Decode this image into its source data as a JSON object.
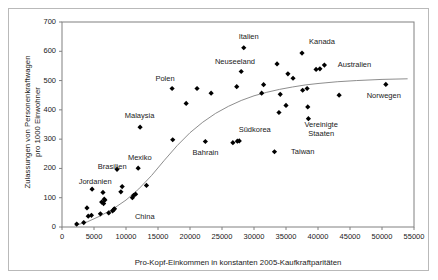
{
  "chart_data": {
    "type": "scatter",
    "title": "",
    "xlabel": "Pro-Kopf-Einkommen in konstanten 2005-Kaufkraftparitäten",
    "ylabel": "Zulassungen von Personenkraftwagen pro 1000 Einwohner",
    "xlim": [
      0,
      55000
    ],
    "ylim": [
      0,
      700
    ],
    "xticks": [
      0,
      5000,
      10000,
      15000,
      20000,
      25000,
      30000,
      35000,
      40000,
      45000,
      50000,
      55000
    ],
    "yticks": [
      0,
      100,
      200,
      300,
      400,
      500,
      600,
      700
    ],
    "xtick_labels": [
      "0",
      "5000",
      "10000",
      "15000",
      "20000",
      "25000",
      "30000",
      "35000",
      "40000",
      "45000",
      "50000",
      "55000"
    ],
    "ytick_labels": [
      "0",
      "100",
      "200",
      "300",
      "400",
      "500",
      "600",
      "700"
    ],
    "grid": false,
    "legend": null,
    "marker": "diamond",
    "marker_color": "#000000",
    "trendline": {
      "present": true,
      "color": "#808080",
      "style": "solid",
      "description": "S-förmige Trendkurve (logistisch)",
      "points": [
        [
          2000,
          5
        ],
        [
          4000,
          18
        ],
        [
          6000,
          38
        ],
        [
          8000,
          62
        ],
        [
          10000,
          92
        ],
        [
          12000,
          130
        ],
        [
          14000,
          176
        ],
        [
          16000,
          228
        ],
        [
          18000,
          278
        ],
        [
          20000,
          322
        ],
        [
          22000,
          358
        ],
        [
          24000,
          388
        ],
        [
          26000,
          412
        ],
        [
          28000,
          432
        ],
        [
          30000,
          448
        ],
        [
          32000,
          460
        ],
        [
          34000,
          470
        ],
        [
          36000,
          478
        ],
        [
          38000,
          485
        ],
        [
          40000,
          490
        ],
        [
          43000,
          496
        ],
        [
          46000,
          500
        ],
        [
          50000,
          504
        ],
        [
          54000,
          506
        ]
      ]
    },
    "points": [
      {
        "x": 2300,
        "y": 10,
        "label": null
      },
      {
        "x": 3400,
        "y": 15,
        "label": null
      },
      {
        "x": 3900,
        "y": 65,
        "label": null
      },
      {
        "x": 4100,
        "y": 37,
        "label": null
      },
      {
        "x": 4600,
        "y": 40,
        "label": null
      },
      {
        "x": 4700,
        "y": 129,
        "label": "Jordanien"
      },
      {
        "x": 6000,
        "y": 45,
        "label": null
      },
      {
        "x": 6200,
        "y": 85,
        "label": null
      },
      {
        "x": 6400,
        "y": 118,
        "label": null
      },
      {
        "x": 6500,
        "y": 80,
        "label": null
      },
      {
        "x": 6600,
        "y": 95,
        "label": null
      },
      {
        "x": 6700,
        "y": 92,
        "label": null
      },
      {
        "x": 7300,
        "y": 48,
        "label": null
      },
      {
        "x": 7900,
        "y": 55,
        "label": null
      },
      {
        "x": 8100,
        "y": 60,
        "label": null
      },
      {
        "x": 8200,
        "y": 62,
        "label": null
      },
      {
        "x": 8600,
        "y": 197,
        "label": "Brasilien"
      },
      {
        "x": 9200,
        "y": 120,
        "label": null
      },
      {
        "x": 9400,
        "y": 138,
        "label": null
      },
      {
        "x": 11000,
        "y": 100,
        "label": null
      },
      {
        "x": 11200,
        "y": 108,
        "label": null
      },
      {
        "x": 11500,
        "y": 112,
        "label": null
      },
      {
        "x": 11900,
        "y": 201,
        "label": "Mexiko"
      },
      {
        "x": 12200,
        "y": 341,
        "label": "Malaysia"
      },
      {
        "x": 13200,
        "y": 142,
        "label": null
      },
      {
        "x": 17200,
        "y": 473,
        "label": "Polen"
      },
      {
        "x": 17300,
        "y": 298,
        "label": null
      },
      {
        "x": 19400,
        "y": 422,
        "label": null
      },
      {
        "x": 21100,
        "y": 473,
        "label": null
      },
      {
        "x": 22400,
        "y": 292,
        "label": "Bahrain"
      },
      {
        "x": 23300,
        "y": 457,
        "label": null
      },
      {
        "x": 26700,
        "y": 288,
        "label": null
      },
      {
        "x": 27300,
        "y": 479,
        "label": null
      },
      {
        "x": 27400,
        "y": 293,
        "label": "Südkorea"
      },
      {
        "x": 27700,
        "y": 294,
        "label": null
      },
      {
        "x": 28000,
        "y": 531,
        "label": "Neuseeland"
      },
      {
        "x": 28400,
        "y": 612,
        "label": "Italien"
      },
      {
        "x": 31200,
        "y": 457,
        "label": null
      },
      {
        "x": 31500,
        "y": 486,
        "label": null
      },
      {
        "x": 33200,
        "y": 257,
        "label": "Taiwan"
      },
      {
        "x": 33600,
        "y": 557,
        "label": null
      },
      {
        "x": 33900,
        "y": 391,
        "label": null
      },
      {
        "x": 34100,
        "y": 453,
        "label": null
      },
      {
        "x": 35000,
        "y": 415,
        "label": null
      },
      {
        "x": 35300,
        "y": 523,
        "label": null
      },
      {
        "x": 36100,
        "y": 508,
        "label": null
      },
      {
        "x": 37500,
        "y": 594,
        "label": "Kanada"
      },
      {
        "x": 37600,
        "y": 467,
        "label": null
      },
      {
        "x": 38300,
        "y": 473,
        "label": null
      },
      {
        "x": 38400,
        "y": 410,
        "label": null
      },
      {
        "x": 38500,
        "y": 370,
        "label": "Vereinigte Staaten"
      },
      {
        "x": 39700,
        "y": 538,
        "label": null
      },
      {
        "x": 40300,
        "y": 540,
        "label": null
      },
      {
        "x": 41000,
        "y": 553,
        "label": "Australien"
      },
      {
        "x": 43300,
        "y": 450,
        "label": null
      },
      {
        "x": 50600,
        "y": 487,
        "label": "Norwegen"
      }
    ],
    "annotations": [
      {
        "text": "China",
        "x": 11400,
        "y": 33,
        "anchor": "label-only"
      },
      {
        "text": "Jordanien",
        "x": 2600,
        "y": 155,
        "anchor": "Jordanien"
      },
      {
        "text": "Brasilien",
        "x": 5600,
        "y": 205,
        "anchor": "Brasilien"
      },
      {
        "text": "Mexiko",
        "x": 10300,
        "y": 235,
        "anchor": "Mexiko"
      },
      {
        "text": "Malaysia",
        "x": 9800,
        "y": 380,
        "anchor": "Malaysia"
      },
      {
        "text": "Polen",
        "x": 14600,
        "y": 505,
        "anchor": "Polen"
      },
      {
        "text": "Bahrain",
        "x": 20400,
        "y": 252,
        "anchor": "Bahrain"
      },
      {
        "text": "Südkorea",
        "x": 27600,
        "y": 330,
        "anchor": "Südkorea"
      },
      {
        "text": "Neuseeland",
        "x": 23900,
        "y": 562,
        "anchor": "Neuseeland"
      },
      {
        "text": "Italien",
        "x": 27600,
        "y": 648,
        "anchor": "Italien"
      },
      {
        "text": "Taiwan",
        "x": 35800,
        "y": 257,
        "anchor": "Taiwan"
      },
      {
        "text": "Kanada",
        "x": 38600,
        "y": 632,
        "anchor": "Kanada"
      },
      {
        "text": "Australien",
        "x": 43100,
        "y": 553,
        "anchor": "Australien"
      },
      {
        "text": "Vereinigte Staaten",
        "x": 40500,
        "y": 350,
        "anchor": "Vereinigte Staaten"
      },
      {
        "text": "Norwegen",
        "x": 47600,
        "y": 448,
        "anchor": "Norwegen"
      }
    ]
  },
  "axis": {
    "x_title": "Pro-Kopf-Einkommen in konstanten 2005-Kaufkraftparitäten",
    "y_title_line1": "Zulassungen von Personenkraftwagen",
    "y_title_line2": "pro 1000 Einwohner"
  },
  "colors": {
    "marker": "#000000",
    "trendline": "#808080",
    "axis": "#808080",
    "text": "#1a1a1a",
    "frame": "#b9b9b9",
    "background": "#ffffff"
  }
}
